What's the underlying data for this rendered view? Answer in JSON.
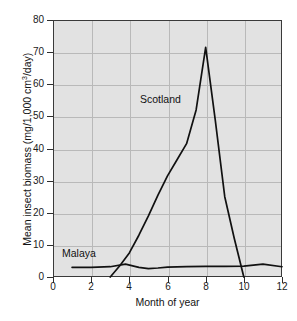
{
  "chart_data": {
    "type": "line",
    "title": "",
    "xlabel": "Month of year",
    "ylabel": "Mean insect biomass (mg/1,000 cm",
    "ylabel_sup": "3",
    "ylabel_tail": "/day)",
    "xlim": [
      0,
      12
    ],
    "ylim": [
      0,
      80
    ],
    "xticks": [
      0,
      2,
      4,
      6,
      8,
      10,
      12
    ],
    "yticks": [
      0,
      10,
      20,
      30,
      40,
      50,
      60,
      70,
      80
    ],
    "grid": true,
    "legend_position": "inline-annotations",
    "annotations": [
      {
        "text": "Scotland",
        "x": 6.4,
        "y": 56
      },
      {
        "text": "Malaya",
        "x": 1.5,
        "y": 8.5
      }
    ],
    "series": [
      {
        "name": "Scotland",
        "color": "#111111",
        "x": [
          3.0,
          3.5,
          4.0,
          4.5,
          5.0,
          5.5,
          6.0,
          6.5,
          7.0,
          7.5,
          8.0,
          8.5,
          9.0,
          9.5,
          10.0
        ],
        "values": [
          0,
          3.5,
          7.5,
          13,
          19,
          25.5,
          31.5,
          36.5,
          41.5,
          52,
          71.5,
          49,
          25,
          12,
          0
        ]
      },
      {
        "name": "Malaya",
        "color": "#111111",
        "x": [
          1.0,
          2.0,
          3.0,
          3.8,
          4.5,
          5.0,
          5.5,
          6.0,
          7.0,
          8.0,
          9.0,
          10.0,
          11.0,
          12.0
        ],
        "values": [
          3.0,
          3.0,
          3.2,
          4.0,
          3.0,
          2.6,
          2.8,
          3.1,
          3.2,
          3.3,
          3.3,
          3.4,
          4.0,
          3.2
        ]
      }
    ]
  }
}
